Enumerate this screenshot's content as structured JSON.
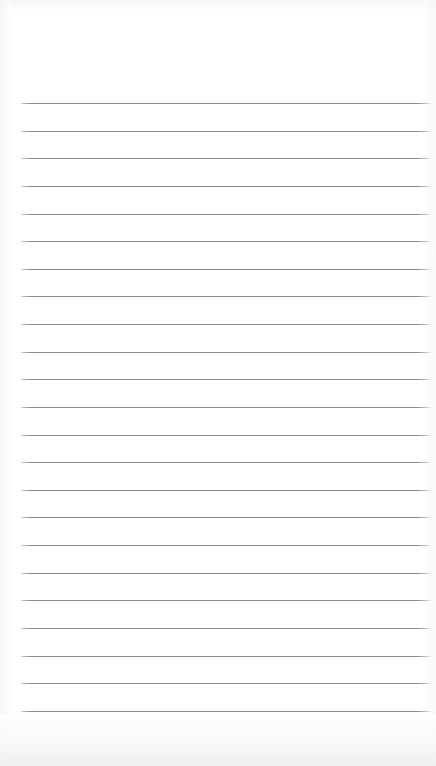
{
  "document": {
    "kind": "lined-note-paper",
    "title": "Lined Note Paper",
    "page_width": 436,
    "page_height": 766,
    "background_color": "#ffffff",
    "orientation": "portrait"
  },
  "header_area": {
    "label": "Unruled top margin",
    "top": 0,
    "height": 96,
    "content": ""
  },
  "ruling": {
    "style": "wide-ruled horizontal lines",
    "line_color": "#8b8b8f",
    "line_shadow_color": "#c9c9cd",
    "line_thickness": 1,
    "line_left": 20,
    "line_right": 432,
    "line_width": 412,
    "first_line_y": 103,
    "last_line_y": 711,
    "line_spacing": 27.6,
    "line_count": 23,
    "margin_rule": false,
    "holes": false,
    "lines": [
      {
        "index": 1,
        "y": 103,
        "text": ""
      },
      {
        "index": 2,
        "y": 131,
        "text": ""
      },
      {
        "index": 3,
        "y": 158,
        "text": ""
      },
      {
        "index": 4,
        "y": 186,
        "text": ""
      },
      {
        "index": 5,
        "y": 214,
        "text": ""
      },
      {
        "index": 6,
        "y": 241,
        "text": ""
      },
      {
        "index": 7,
        "y": 269,
        "text": ""
      },
      {
        "index": 8,
        "y": 296,
        "text": ""
      },
      {
        "index": 9,
        "y": 324,
        "text": ""
      },
      {
        "index": 10,
        "y": 352,
        "text": ""
      },
      {
        "index": 11,
        "y": 379,
        "text": ""
      },
      {
        "index": 12,
        "y": 407,
        "text": ""
      },
      {
        "index": 13,
        "y": 435,
        "text": ""
      },
      {
        "index": 14,
        "y": 462,
        "text": ""
      },
      {
        "index": 15,
        "y": 490,
        "text": ""
      },
      {
        "index": 16,
        "y": 517,
        "text": ""
      },
      {
        "index": 17,
        "y": 545,
        "text": ""
      },
      {
        "index": 18,
        "y": 573,
        "text": ""
      },
      {
        "index": 19,
        "y": 600,
        "text": ""
      },
      {
        "index": 20,
        "y": 628,
        "text": ""
      },
      {
        "index": 21,
        "y": 656,
        "text": ""
      },
      {
        "index": 22,
        "y": 683,
        "text": ""
      },
      {
        "index": 23,
        "y": 711,
        "text": ""
      }
    ]
  },
  "footer_area": {
    "label": "Unruled bottom margin",
    "top": 712,
    "height": 54,
    "content": ""
  }
}
